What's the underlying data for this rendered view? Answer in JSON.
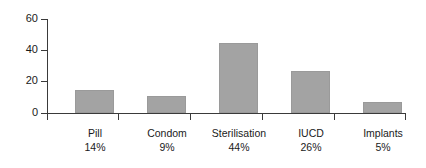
{
  "chart_data": {
    "type": "bar",
    "title": "",
    "subtitle": "",
    "xlabel": "",
    "ylabel": "",
    "categories": [
      "Pill",
      "Condom",
      "Sterilisation",
      "IUCD",
      "Implants"
    ],
    "values": [
      14,
      9,
      44,
      26,
      5
    ],
    "bar_values_plotted": [
      15,
      11,
      45,
      27,
      7
    ],
    "percent_labels": [
      "14%",
      "9%",
      "44%",
      "26%",
      "5%"
    ],
    "ylim": [
      0,
      60
    ],
    "yticks": [
      0,
      20,
      40,
      60
    ],
    "ytick_labels": [
      "0",
      "20",
      "40",
      "60"
    ],
    "grid": false,
    "legend": false,
    "legend_position": "none",
    "series": [
      {
        "name": "",
        "values": [
          15,
          11,
          45,
          27,
          7
        ]
      }
    ],
    "colors": {
      "bar_fill": "#a3a3a3",
      "bar_edge": "#9a9a9a",
      "axis": "#3a3a3a",
      "text": "#1a1a1a",
      "background": "#ffffff"
    }
  },
  "axis": {
    "y_labels": [
      "60",
      "40",
      "20",
      "0"
    ]
  },
  "categories_display": [
    {
      "name": "Pill",
      "percent": "14%"
    },
    {
      "name": "Condom",
      "percent": "9%"
    },
    {
      "name": "Sterilisation",
      "percent": "44%"
    },
    {
      "name": "IUCD",
      "percent": "26%"
    },
    {
      "name": "Implants",
      "percent": "5%"
    }
  ]
}
